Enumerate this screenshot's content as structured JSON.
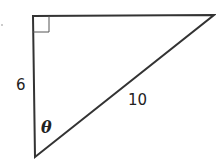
{
  "diagram": {
    "type": "right-triangle",
    "vertices": {
      "right_angle": [
        33,
        16
      ],
      "top_right": [
        214,
        15
      ],
      "bottom": [
        35,
        157
      ]
    },
    "labels": {
      "vertical_side": "6",
      "hypotenuse": "10",
      "angle": "θ"
    },
    "stroke_color": "#333333"
  }
}
